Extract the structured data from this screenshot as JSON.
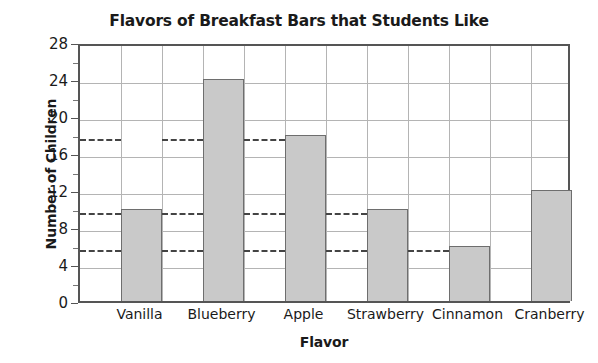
{
  "chart_data": {
    "type": "bar",
    "title": "Flavors of Breakfast Bars that Students Like",
    "xlabel": "Flavor",
    "ylabel": "Number of Children",
    "categories": [
      "Vanilla",
      "Blueberry",
      "Apple",
      "Strawberry",
      "Cinnamon",
      "Cranberry"
    ],
    "values": [
      10,
      24,
      18,
      10,
      6,
      12
    ],
    "ylim": [
      0,
      28
    ],
    "ytick_major": [
      0,
      4,
      8,
      12,
      16,
      20,
      24,
      28
    ],
    "ytick_major_labels": [
      "0",
      "4",
      "8",
      "12",
      "16",
      "20",
      "24",
      "28"
    ],
    "ytick_minor": [
      2,
      6,
      10,
      14,
      18,
      22,
      26
    ],
    "grid": true,
    "legend": "none",
    "guide_lines": [
      18,
      10,
      6
    ],
    "bar_fill_color": "#c9c9c9",
    "bar_edge_color": "#6e6e6e",
    "grid_color": "#b4b4b4",
    "axis_color": "#555555",
    "guide_line_color": "#444444",
    "text_color": "#1a1a1a",
    "background_color": "#ffffff"
  }
}
